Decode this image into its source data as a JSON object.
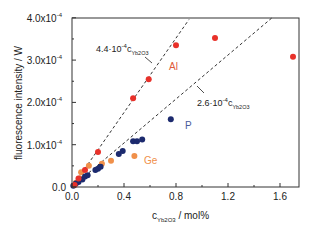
{
  "chart_data": {
    "type": "scatter",
    "title": "",
    "xlabel": "c_Yb2O3 / mol%",
    "xlabel_main": "c",
    "xlabel_sub": "Yb2O3",
    "xlabel_unit": " / mol%",
    "ylabel": "fluorescence intensity / W",
    "xlim": [
      0,
      1.75
    ],
    "ylim": [
      0,
      0.0004
    ],
    "grid": false,
    "x_ticks": [
      {
        "value": 0.0,
        "label": "0.0"
      },
      {
        "value": 0.4,
        "label": "0.4"
      },
      {
        "value": 0.8,
        "label": "0.8"
      },
      {
        "value": 1.2,
        "label": "1.2"
      },
      {
        "value": 1.6,
        "label": "1.6"
      }
    ],
    "y_ticks": [
      {
        "value": 0.0,
        "label": "0.0",
        "exp": ""
      },
      {
        "value": 1.0,
        "label": "1.0x10",
        "exp": "-4"
      },
      {
        "value": 2.0,
        "label": "2.0x10",
        "exp": "-4"
      },
      {
        "value": 3.0,
        "label": "3.0x10",
        "exp": "-4"
      },
      {
        "value": 4.0,
        "label": "4.0x10",
        "exp": "-4"
      }
    ],
    "series": [
      {
        "name": "Al",
        "color": "#e8312a",
        "label_color": "#e0593a",
        "points": [
          {
            "x": 0.02,
            "y": 0.05
          },
          {
            "x": 0.05,
            "y": 0.2
          },
          {
            "x": 0.1,
            "y": 0.4
          },
          {
            "x": 0.2,
            "y": 0.83
          },
          {
            "x": 0.47,
            "y": 2.1
          },
          {
            "x": 0.59,
            "y": 2.55
          },
          {
            "x": 0.8,
            "y": 3.35
          },
          {
            "x": 1.1,
            "y": 3.52
          },
          {
            "x": 1.7,
            "y": 3.08
          }
        ]
      },
      {
        "name": "P",
        "color": "#1c2a6e",
        "label_color": "#4a5a9a",
        "points": [
          {
            "x": 0.01,
            "y": 0.03
          },
          {
            "x": 0.03,
            "y": 0.08
          },
          {
            "x": 0.05,
            "y": 0.12
          },
          {
            "x": 0.08,
            "y": 0.18
          },
          {
            "x": 0.1,
            "y": 0.25
          },
          {
            "x": 0.12,
            "y": 0.28
          },
          {
            "x": 0.18,
            "y": 0.4
          },
          {
            "x": 0.2,
            "y": 0.43
          },
          {
            "x": 0.22,
            "y": 0.48
          },
          {
            "x": 0.36,
            "y": 0.78
          },
          {
            "x": 0.39,
            "y": 0.85
          },
          {
            "x": 0.47,
            "y": 1.08
          },
          {
            "x": 0.5,
            "y": 1.08
          },
          {
            "x": 0.54,
            "y": 1.12
          },
          {
            "x": 0.76,
            "y": 1.6
          }
        ]
      },
      {
        "name": "Ge",
        "color": "#f0904a",
        "label_color": "#f0904a",
        "points": [
          {
            "x": 0.03,
            "y": 0.1
          },
          {
            "x": 0.06,
            "y": 0.2
          },
          {
            "x": 0.07,
            "y": 0.35
          },
          {
            "x": 0.13,
            "y": 0.5
          },
          {
            "x": 0.23,
            "y": 0.55
          },
          {
            "x": 0.3,
            "y": 0.62
          },
          {
            "x": 0.48,
            "y": 0.73
          }
        ]
      }
    ],
    "fit_lines": [
      {
        "label_main": "4.4·10",
        "label_exp": "-4",
        "label_c": "c",
        "label_sub": "Yb2O3",
        "slope": 4.4,
        "x_end": 0.9
      },
      {
        "label_main": "2.6·10",
        "label_exp": "-4",
        "label_c": "c",
        "label_sub": "Yb2O3",
        "slope": 2.6,
        "x_end": 1.55
      }
    ],
    "annotations": [
      {
        "text": "Al",
        "x": 0.67,
        "y": 2.95
      },
      {
        "text": "P",
        "x": 0.88,
        "y": 1.45
      },
      {
        "text": "Ge",
        "x": 0.6,
        "y": 0.63
      }
    ]
  }
}
